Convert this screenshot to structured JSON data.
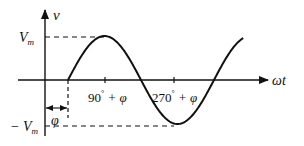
{
  "diagram": {
    "y_axis_label": "v",
    "x_axis_label": "ωt",
    "peak_label_main": "V",
    "peak_label_sub": "m",
    "trough_label_main": "− V",
    "trough_label_sub": "m",
    "phase_label": "φ",
    "tick_labels": [
      {
        "deg": "90",
        "sup": "°",
        "rest": " + φ"
      },
      {
        "deg": "270",
        "sup": "°",
        "rest": " + φ"
      }
    ],
    "curve": {
      "type": "sine",
      "amplitude": "V_m",
      "phase_shift": "φ",
      "periods_shown": 1.2
    },
    "colors": {
      "stroke": "#111111",
      "background": "#ffffff"
    }
  }
}
